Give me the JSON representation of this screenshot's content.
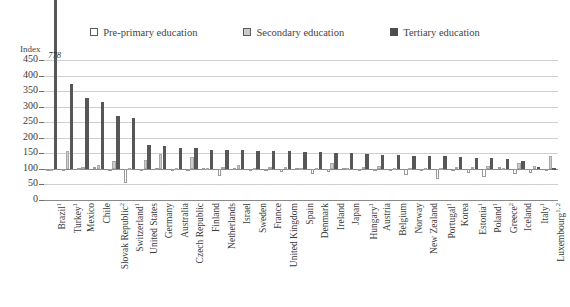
{
  "legend": {
    "items": [
      {
        "name": "pre-primary",
        "label": "Pre-primary education",
        "color": "#ffffff"
      },
      {
        "name": "secondary",
        "label": "Secondary education",
        "color": "#c9c9c9"
      },
      {
        "name": "tertiary",
        "label": "Tertiary education",
        "color": "#4c4c4c"
      }
    ]
  },
  "axis": {
    "index_caption": "Index",
    "yticks": [
      "450",
      "400",
      "350",
      "300",
      "250",
      "200",
      "150",
      "100",
      "50",
      "0"
    ]
  },
  "annotations": [
    {
      "name": "brazil-tertiary-value",
      "text": "778",
      "category": "Brazil",
      "series": "Tertiary education",
      "value": 778
    }
  ],
  "chart_data": {
    "type": "bar",
    "title": "",
    "subtitle": "",
    "xlabel": "",
    "ylabel": "Index",
    "ylim": [
      0,
      450
    ],
    "ytick_step": 50,
    "grid": true,
    "legend_position": "top-center",
    "baseline": 100,
    "categories": [
      "Brazil¹",
      "Turkey¹",
      "Mexico",
      "Chile",
      "Slovak Republic²",
      "Switzerland¹",
      "United States",
      "Germany",
      "Australia",
      "Czech Republic",
      "Finland",
      "Netherlands",
      "Israel",
      "Sweden",
      "France",
      "United Kingdom",
      "Spain",
      "Denmark",
      "Ireland",
      "Japan",
      "Hungary¹",
      "Austria",
      "Belgium",
      "Norway",
      "New Zealand",
      "Portugal¹",
      "Korea",
      "Estonia¹",
      "Poland¹",
      "Greece²",
      "Iceland",
      "Italy¹",
      "Luxembourg¹,²"
    ],
    "series": [
      {
        "name": "Pre-primary education",
        "color": "#ffffff",
        "values": [
          97,
          101,
          103,
          107,
          101,
          55,
          95,
          104,
          101,
          97,
          103,
          78,
          104,
          96,
          100,
          91,
          104,
          83,
          89,
          102,
          93,
          96,
          97,
          81,
          99,
          68,
          95,
          88,
          73,
          105,
          82,
          88,
          96
        ]
      },
      {
        "name": "Secondary education",
        "color": "#c9c9c9",
        "values": [
          101,
          158,
          106,
          112,
          126,
          103,
          130,
          147,
          104,
          139,
          103,
          106,
          114,
          102,
          106,
          107,
          103,
          104,
          118,
          103,
          107,
          108,
          103,
          103,
          102,
          104,
          105,
          106,
          110,
          103,
          118,
          110,
          141
        ]
      },
      {
        "name": "Tertiary education",
        "color": "#575757",
        "values": [
          778,
          372,
          327,
          314,
          271,
          263,
          177,
          175,
          168,
          166,
          162,
          161,
          160,
          159,
          157,
          156,
          155,
          153,
          152,
          150,
          148,
          146,
          145,
          143,
          141,
          140,
          138,
          135,
          134,
          131,
          126,
          106,
          103
        ]
      }
    ]
  }
}
